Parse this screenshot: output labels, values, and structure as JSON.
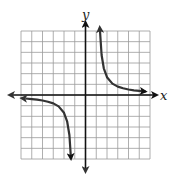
{
  "chart_data": {
    "type": "line",
    "title": "",
    "xlabel": "x",
    "ylabel": "y",
    "grid": true,
    "xlim": [
      -6,
      6
    ],
    "ylim": [
      -6,
      6
    ],
    "grid_step": 1,
    "tick_labels": false,
    "legend": null,
    "series": [
      {
        "name": "right branch",
        "description": "approx y = 1.5/(x - 1.1), x > 1.1, arrows at both ends",
        "points": [
          [
            1.35,
            6.0
          ],
          [
            1.5,
            3.75
          ],
          [
            1.7,
            2.5
          ],
          [
            2.0,
            1.67
          ],
          [
            2.5,
            1.07
          ],
          [
            3.0,
            0.79
          ],
          [
            3.5,
            0.63
          ],
          [
            4.0,
            0.52
          ],
          [
            4.5,
            0.44
          ],
          [
            5.0,
            0.38
          ],
          [
            5.6,
            0.33
          ]
        ]
      },
      {
        "name": "left branch",
        "description": "approx y = 1.5/(x + 1.1), x < -1.1, arrows at both ends",
        "points": [
          [
            -5.6,
            -0.33
          ],
          [
            -5.0,
            -0.38
          ],
          [
            -4.5,
            -0.44
          ],
          [
            -4.0,
            -0.52
          ],
          [
            -3.5,
            -0.63
          ],
          [
            -3.0,
            -0.79
          ],
          [
            -2.5,
            -1.07
          ],
          [
            -2.0,
            -1.67
          ],
          [
            -1.7,
            -2.5
          ],
          [
            -1.5,
            -3.75
          ],
          [
            -1.35,
            -6.0
          ]
        ]
      }
    ]
  },
  "labels": {
    "x_axis": "x",
    "y_axis": "y"
  },
  "colors": {
    "grid": "#9a9a9a",
    "axis": "#111111",
    "curve": "#333333",
    "background": "#ffffff"
  }
}
